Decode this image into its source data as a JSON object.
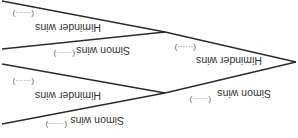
{
  "diagram": {
    "type": "probability-tree",
    "orientation": "rotated-180",
    "root": {
      "branches": [
        {
          "label": "Himinder wins",
          "probability": "(……)",
          "branches": [
            {
              "label": "Himinder wins",
              "probability": "(……)"
            },
            {
              "label": "Simon wins",
              "probability": "(……)"
            }
          ]
        },
        {
          "label": "Simon wins",
          "probability": "(……)",
          "branches": [
            {
              "label": "Himinder wins",
              "probability": "(……)"
            },
            {
              "label": "Simon wins",
              "probability": "(……)"
            }
          ]
        }
      ]
    }
  }
}
